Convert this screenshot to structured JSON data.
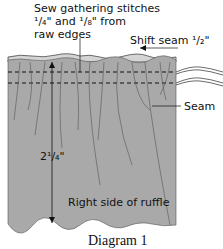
{
  "diagram": {
    "callouts": {
      "gathering_line1": "Sew gathering stitches",
      "gathering_line2": "¹/₄\" and ¹/₈\" from",
      "gathering_line3": "raw edges",
      "shift_seam": "Shift seam ¹/₂\"",
      "seam": "Seam",
      "height": "2¹/₄\"",
      "right_side": "Right side of ruffle"
    },
    "caption": "Diagram 1",
    "colors": {
      "fabric": "#a9a9a9",
      "fabric_top_edge": "#d4d4d4",
      "line": "#1a1a1a"
    }
  }
}
